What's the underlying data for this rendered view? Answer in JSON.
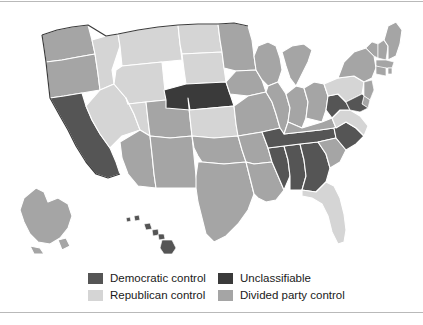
{
  "figure": {
    "title": "",
    "background_color": "#ffffff",
    "frame_color": "#b9b9b9"
  },
  "palette": {
    "democratic": "#555555",
    "republican": "#d5d5d5",
    "unclassifiable": "#3a3a3a",
    "divided": "#a5a5a5",
    "border": "#ffffff",
    "outline": "#3c3c3c"
  },
  "legend": {
    "column_1": [
      {
        "label": "Democratic control",
        "color": "#555555",
        "key": "democratic"
      },
      {
        "label": "Republican control",
        "color": "#d5d5d5",
        "key": "republican"
      }
    ],
    "column_2": [
      {
        "label": "Unclassifiable",
        "color": "#3a3a3a",
        "key": "unclassifiable"
      },
      {
        "label": "Divided party control",
        "color": "#a5a5a5",
        "key": "divided"
      }
    ]
  },
  "chart_data": {
    "type": "map",
    "title": "",
    "subtitle": "",
    "map_region": "United States",
    "value_field": "party_control",
    "categories": [
      "Democratic control",
      "Republican control",
      "Unclassifiable",
      "Divided party control"
    ],
    "category_colors": {
      "Democratic control": "#555555",
      "Republican control": "#d5d5d5",
      "Unclassifiable": "#3a3a3a",
      "Divided party control": "#a5a5a5"
    },
    "counts": {
      "Democratic control": 8,
      "Republican control": 12,
      "Unclassifiable": 1,
      "Divided party control": 29
    },
    "states": [
      {
        "code": "AL",
        "name": "Alabama",
        "value": "Democratic control"
      },
      {
        "code": "AK",
        "name": "Alaska",
        "value": "Divided party control"
      },
      {
        "code": "AZ",
        "name": "Arizona",
        "value": "Divided party control"
      },
      {
        "code": "AR",
        "name": "Arkansas",
        "value": "Divided party control"
      },
      {
        "code": "CA",
        "name": "California",
        "value": "Democratic control"
      },
      {
        "code": "CO",
        "name": "Colorado",
        "value": "Divided party control"
      },
      {
        "code": "CT",
        "name": "Connecticut",
        "value": "Divided party control"
      },
      {
        "code": "DE",
        "name": "Delaware",
        "value": "Divided party control"
      },
      {
        "code": "FL",
        "name": "Florida",
        "value": "Republican control"
      },
      {
        "code": "GA",
        "name": "Georgia",
        "value": "Democratic control"
      },
      {
        "code": "HI",
        "name": "Hawaii",
        "value": "Democratic control"
      },
      {
        "code": "ID",
        "name": "Idaho",
        "value": "Republican control"
      },
      {
        "code": "IL",
        "name": "Illinois",
        "value": "Divided party control"
      },
      {
        "code": "IN",
        "name": "Indiana",
        "value": "Divided party control"
      },
      {
        "code": "IA",
        "name": "Iowa",
        "value": "Divided party control"
      },
      {
        "code": "KS",
        "name": "Kansas",
        "value": "Republican control"
      },
      {
        "code": "KY",
        "name": "Kentucky",
        "value": "Divided party control"
      },
      {
        "code": "LA",
        "name": "Louisiana",
        "value": "Divided party control"
      },
      {
        "code": "ME",
        "name": "Maine",
        "value": "Divided party control"
      },
      {
        "code": "MD",
        "name": "Maryland",
        "value": "Democratic control"
      },
      {
        "code": "MA",
        "name": "Massachusetts",
        "value": "Divided party control"
      },
      {
        "code": "MI",
        "name": "Michigan",
        "value": "Divided party control"
      },
      {
        "code": "MN",
        "name": "Minnesota",
        "value": "Divided party control"
      },
      {
        "code": "MS",
        "name": "Mississippi",
        "value": "Democratic control"
      },
      {
        "code": "MO",
        "name": "Missouri",
        "value": "Divided party control"
      },
      {
        "code": "MT",
        "name": "Montana",
        "value": "Republican control"
      },
      {
        "code": "NE",
        "name": "Nebraska",
        "value": "Unclassifiable"
      },
      {
        "code": "NV",
        "name": "Nevada",
        "value": "Republican control"
      },
      {
        "code": "NH",
        "name": "New Hampshire",
        "value": "Divided party control"
      },
      {
        "code": "NJ",
        "name": "New Jersey",
        "value": "Divided party control"
      },
      {
        "code": "NM",
        "name": "New Mexico",
        "value": "Divided party control"
      },
      {
        "code": "NY",
        "name": "New York",
        "value": "Divided party control"
      },
      {
        "code": "NC",
        "name": "North Carolina",
        "value": "Democratic control"
      },
      {
        "code": "ND",
        "name": "North Dakota",
        "value": "Republican control"
      },
      {
        "code": "OH",
        "name": "Ohio",
        "value": "Divided party control"
      },
      {
        "code": "OK",
        "name": "Oklahoma",
        "value": "Divided party control"
      },
      {
        "code": "OR",
        "name": "Oregon",
        "value": "Divided party control"
      },
      {
        "code": "PA",
        "name": "Pennsylvania",
        "value": "Republican control"
      },
      {
        "code": "RI",
        "name": "Rhode Island",
        "value": "Divided party control"
      },
      {
        "code": "SC",
        "name": "South Carolina",
        "value": "Divided party control"
      },
      {
        "code": "SD",
        "name": "South Dakota",
        "value": "Republican control"
      },
      {
        "code": "TN",
        "name": "Tennessee",
        "value": "Democratic control"
      },
      {
        "code": "TX",
        "name": "Texas",
        "value": "Divided party control"
      },
      {
        "code": "UT",
        "name": "Utah",
        "value": "Republican control"
      },
      {
        "code": "VT",
        "name": "Vermont",
        "value": "Divided party control"
      },
      {
        "code": "VA",
        "name": "Virginia",
        "value": "Republican control"
      },
      {
        "code": "WA",
        "name": "Washington",
        "value": "Divided party control"
      },
      {
        "code": "WV",
        "name": "West Virginia",
        "value": "Democratic control"
      },
      {
        "code": "WI",
        "name": "Wisconsin",
        "value": "Divided party control"
      },
      {
        "code": "WY",
        "name": "Wyoming",
        "value": "Republican control"
      }
    ]
  }
}
